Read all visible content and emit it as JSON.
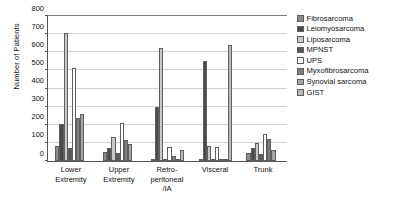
{
  "chart_data": {
    "type": "bar",
    "title": "",
    "xlabel": "",
    "ylabel": "Number of Patients",
    "ylim": [
      0,
      800
    ],
    "ytick_values": [
      0,
      100,
      200,
      300,
      400,
      500,
      600,
      700,
      800
    ],
    "ytick_labels": [
      "0",
      "100",
      "200",
      "300",
      "400",
      "500",
      "600",
      "700",
      "800"
    ],
    "grid": true,
    "legend_position": "right",
    "categories": [
      "Lower Extremity",
      "Upper Extremity",
      "Retro-peritoneal /IA",
      "Visceral",
      "Trunk"
    ],
    "category_lines": [
      [
        "Lower",
        "Extremity"
      ],
      [
        "Upper",
        "Extremity"
      ],
      [
        "Retro-",
        "peritoneal",
        "/IA"
      ],
      [
        "Visceral"
      ],
      [
        "Trunk"
      ]
    ],
    "series": [
      {
        "name": "Fibrosarcoma",
        "color": "#8c8c8c",
        "values": [
          85,
          48,
          8,
          5,
          45
        ]
      },
      {
        "name": "Leiomyosarcoma",
        "color": "#4a4a4a",
        "values": [
          205,
          73,
          295,
          550,
          72
        ]
      },
      {
        "name": "Liposarcoma",
        "color": "#c9c9c9",
        "values": [
          700,
          130,
          620,
          85,
          98
        ]
      },
      {
        "name": "MPNST",
        "color": "#5a5a5a",
        "values": [
          70,
          42,
          12,
          10,
          40
        ]
      },
      {
        "name": "UPS",
        "color": "#ffffff",
        "values": [
          510,
          208,
          78,
          78,
          150
        ]
      },
      {
        "name": "Myxofibrosarcoma",
        "color": "#7d7d7d",
        "values": [
          235,
          113,
          30,
          10,
          118
        ]
      },
      {
        "name": "Synovial sarcoma",
        "color": "#a6a6a6",
        "values": [
          258,
          95,
          12,
          5,
          60
        ]
      },
      {
        "name": "GIST",
        "color": "#bdbdbd",
        "values": [
          0,
          0,
          62,
          635,
          0
        ]
      }
    ]
  }
}
